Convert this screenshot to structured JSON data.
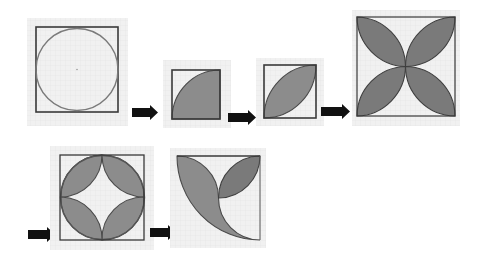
{
  "figure": {
    "background": "#ffffff",
    "paper_color": "#f1f1f1",
    "line_color": "#3a3a3a",
    "shade_color": "#8c8c8c",
    "arrow_color": "#111111",
    "panels": [
      {
        "id": 1,
        "label": "circle-inscribed-in-square",
        "shape": "circle inscribed in square"
      },
      {
        "id": 2,
        "label": "quarter-circle",
        "shape": "shaded quarter disc centered at bottom-right corner"
      },
      {
        "id": 3,
        "label": "single-lens",
        "shape": "shaded lens between bottom-left and top-right corners"
      },
      {
        "id": 4,
        "label": "four-petal-flower",
        "shape": "four shaded lenses from center to each corner"
      },
      {
        "id": 5,
        "label": "four-lenses-on-circle",
        "shape": "four shaded lenses between side midpoints around inscribed circle"
      },
      {
        "id": 6,
        "label": "crescent-with-lens",
        "shape": "shaded curved region from top-left to bottom-right with a lens in top-right quadrant"
      }
    ],
    "arrows": [
      {
        "from": 1,
        "to": 2,
        "icon": "right-arrow"
      },
      {
        "from": 2,
        "to": 3,
        "icon": "right-arrow"
      },
      {
        "from": 3,
        "to": 4,
        "icon": "right-arrow"
      },
      {
        "from": 4,
        "to": 5,
        "icon": "right-arrow"
      },
      {
        "from": 5,
        "to": 6,
        "icon": "right-arrow"
      }
    ]
  }
}
